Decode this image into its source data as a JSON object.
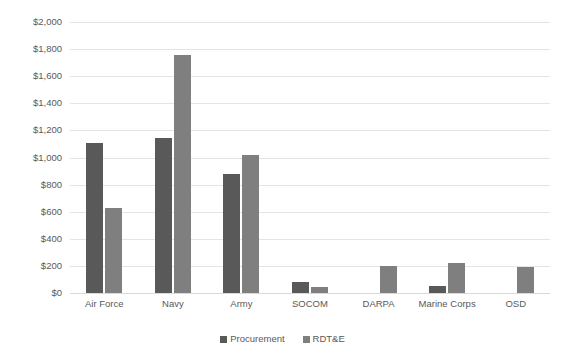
{
  "chart_data": {
    "type": "bar",
    "title": "",
    "xlabel": "",
    "ylabel": "",
    "ylim": [
      0,
      2000
    ],
    "ytick_step": 200,
    "grid": true,
    "legend_position": "bottom",
    "categories": [
      "Air Force",
      "Navy",
      "Army",
      "SOCOM",
      "DARPA",
      "Marine Corps",
      "OSD"
    ],
    "ytick_labels": [
      "$2,000",
      "$1,800",
      "$1,600",
      "$1,400",
      "$1,200",
      "$1,000",
      "$800",
      "$600",
      "$400",
      "$200",
      "$0"
    ],
    "ytick_values": [
      2000,
      1800,
      1600,
      1400,
      1200,
      1000,
      800,
      600,
      400,
      200,
      0
    ],
    "series": [
      {
        "name": "Procurement",
        "color": "#595959",
        "values": [
          1110,
          1145,
          875,
          80,
          null,
          55,
          null
        ]
      },
      {
        "name": "RDT&E",
        "color": "#7f7f7f",
        "values": [
          625,
          1755,
          1015,
          45,
          200,
          220,
          190
        ]
      }
    ]
  },
  "legend": {
    "items": [
      {
        "label": "Procurement",
        "color": "#595959"
      },
      {
        "label": "RDT&E",
        "color": "#7f7f7f"
      }
    ]
  },
  "colors": {
    "procurement": "#595959",
    "rdte": "#7f7f7f",
    "gridline": "#e4e4e4",
    "axis_text": "#595959",
    "background": "#ffffff"
  }
}
